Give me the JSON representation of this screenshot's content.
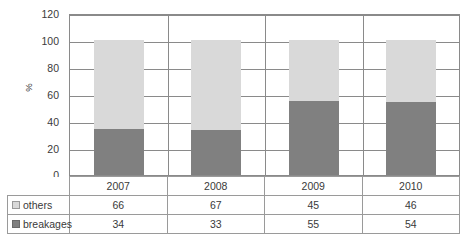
{
  "chart_data": {
    "type": "bar",
    "subtype": "stacked-column-100",
    "title": "",
    "xlabel": "",
    "ylabel": "%",
    "ylim": [
      0,
      120
    ],
    "yticks": [
      0,
      20,
      40,
      60,
      80,
      100,
      120
    ],
    "ytick_labels": [
      "0",
      "20",
      "40",
      "60",
      "80",
      "100",
      "120"
    ],
    "grid": true,
    "legend_position": "data-table-left",
    "categories": [
      "2007",
      "2008",
      "2009",
      "2010"
    ],
    "series": [
      {
        "name": "others",
        "values": [
          66,
          67,
          45,
          46
        ],
        "color": "#d9d9d9",
        "stack_order": 2
      },
      {
        "name": "breakages",
        "values": [
          34,
          33,
          55,
          54
        ],
        "color": "#808080",
        "stack_order": 1
      }
    ]
  },
  "axis": {
    "y_label": "%",
    "ticks": [
      {
        "value": 120,
        "label": "120"
      },
      {
        "value": 100,
        "label": "100"
      },
      {
        "value": 80,
        "label": "80"
      },
      {
        "value": 60,
        "label": "60"
      },
      {
        "value": 40,
        "label": "40"
      },
      {
        "value": 20,
        "label": "20"
      },
      {
        "value": 0,
        "label": "0"
      }
    ]
  },
  "data_table": {
    "year_row": [
      "2007",
      "2008",
      "2009",
      "2010"
    ],
    "rows": [
      {
        "label": "others",
        "swatch": "light-gray-square",
        "values": [
          "66",
          "67",
          "45",
          "46"
        ]
      },
      {
        "label": "breakages",
        "swatch": "dark-gray-square",
        "values": [
          "34",
          "33",
          "55",
          "54"
        ]
      }
    ]
  },
  "colors": {
    "others": "#d9d9d9",
    "breakages": "#808080",
    "gridline": "#8a8a8a",
    "table_border": "#9a9a9a",
    "text": "#3a3a3a"
  }
}
